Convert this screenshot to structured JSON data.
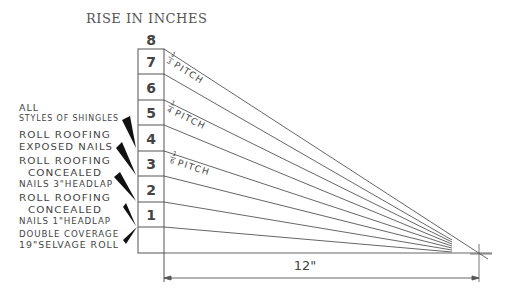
{
  "title": "RISE IN INCHES",
  "rise_scale": {
    "top_label": "8",
    "rows": [
      "7",
      "6",
      "5",
      "4",
      "3",
      "2",
      "1",
      ""
    ]
  },
  "pitches": [
    {
      "num": "1",
      "den": "3",
      "word": "PITCH",
      "rise": 8
    },
    {
      "num": "1",
      "den": "4",
      "word": "PITCH",
      "rise": 6
    },
    {
      "num": "1",
      "den": "6",
      "word": "PITCH",
      "rise": 4
    }
  ],
  "materials": [
    {
      "lines": [
        "ALL",
        "STYLES OF SHINGLES"
      ],
      "min_rise": 4
    },
    {
      "lines": [
        "ROLL ROOFING",
        "EXPOSED NAILS"
      ],
      "min_rise": 3
    },
    {
      "lines": [
        "ROLL ROOFING",
        "CONCEALED",
        "NAILS 3\"HEADLAP"
      ],
      "min_rise": 2
    },
    {
      "lines": [
        "ROLL ROOFING",
        "CONCEALED",
        "NAILS 1\"HEADLAP"
      ],
      "min_rise": 1
    },
    {
      "lines": [
        "DOUBLE COVERAGE",
        "19\"SELVAGE ROLL"
      ],
      "min_rise": 0
    }
  ],
  "run_dimension": "12\"",
  "colors": {
    "line": "#555555",
    "text": "#444444",
    "pointer": "#111111"
  }
}
